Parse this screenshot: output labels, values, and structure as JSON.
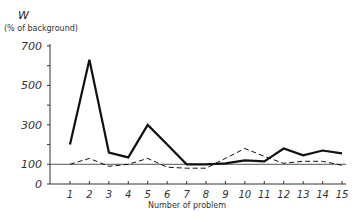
{
  "chart_data": {
    "type": "line",
    "title": "",
    "ylabel_symbol": "W",
    "ylabel": "(% of background)",
    "xlabel": "Number of problem",
    "x": [
      1,
      2,
      3,
      4,
      5,
      6,
      7,
      8,
      9,
      10,
      11,
      12,
      13,
      14,
      15
    ],
    "yticks": [
      0,
      100,
      300,
      500,
      700
    ],
    "ylim": [
      0,
      700
    ],
    "reference_line": 100,
    "grid": false,
    "legend": null,
    "series": [
      {
        "name": "solid",
        "style": "solid",
        "values": [
          200,
          630,
          160,
          135,
          300,
          200,
          100,
          100,
          105,
          120,
          115,
          180,
          145,
          170,
          155
        ]
      },
      {
        "name": "dashed",
        "style": "dashed",
        "values": [
          100,
          130,
          90,
          100,
          130,
          85,
          80,
          80,
          130,
          180,
          140,
          105,
          115,
          115,
          95
        ]
      }
    ]
  }
}
